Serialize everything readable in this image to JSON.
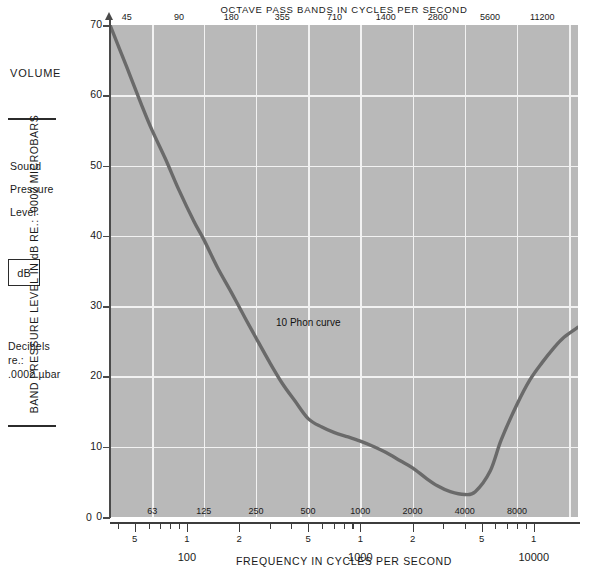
{
  "sidebar": {
    "title": "VOLUME",
    "lines": [
      "Sound",
      "Pressure",
      "Level"
    ],
    "unit_box": "dB",
    "description": [
      "Decibels",
      "re.:",
      ".0002 µbar"
    ]
  },
  "chart_data": {
    "type": "line",
    "title": "OCTAVE PASS BANDS IN CYCLES PER SECOND",
    "xlabel": "FREQUENCY IN CYCLES PER SECOND",
    "ylabel": "BAND PRESSURE LEVEL IN dB RE.: .0002 MICROBARS",
    "annotation": "10 Phon curve",
    "grid": true,
    "legend_position": "none",
    "xscale": "log",
    "xlim": [
      36,
      18000
    ],
    "ylim": [
      0,
      70
    ],
    "yticks": [
      0,
      10,
      20,
      30,
      40,
      50,
      60,
      70
    ],
    "octave_band_centers_top": [
      45,
      90,
      180,
      355,
      710,
      1400,
      2800,
      5600,
      11200
    ],
    "octave_band_labels_bottom": [
      63,
      125,
      250,
      500,
      1000,
      2000,
      4000,
      8000
    ],
    "ruler_minor_labels": [
      "5",
      "1",
      "2",
      "5",
      "1",
      "2",
      "5",
      "1"
    ],
    "ruler_decade_labels": [
      "100",
      "1000",
      "10000"
    ],
    "series": [
      {
        "name": "10 Phon curve",
        "x": [
          36,
          45,
          55,
          63,
          75,
          90,
          110,
          125,
          150,
          180,
          220,
          250,
          300,
          355,
          420,
          500,
          600,
          710,
          850,
          1000,
          1200,
          1400,
          1700,
          2000,
          2400,
          2800,
          3300,
          4000,
          4600,
          5600,
          6500,
          8000,
          9500,
          11200,
          13000,
          15000,
          18000
        ],
        "y": [
          70.0,
          64.0,
          58.5,
          55.0,
          51.0,
          46.5,
          42.0,
          39.5,
          35.5,
          32.0,
          28.0,
          25.5,
          22.0,
          19.0,
          16.5,
          14.0,
          12.8,
          12.0,
          11.4,
          10.8,
          10.0,
          9.2,
          8.0,
          7.0,
          5.5,
          4.4,
          3.6,
          3.2,
          3.6,
          6.5,
          11.0,
          16.0,
          19.5,
          22.0,
          24.0,
          25.6,
          27.0
        ]
      }
    ]
  }
}
